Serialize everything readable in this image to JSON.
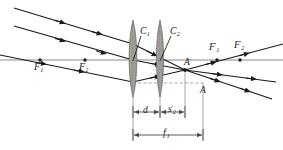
{
  "figure": {
    "type": "optical-ray-diagram",
    "colors": {
      "ray": "#1a1a1a",
      "axis": "#8c8c8c",
      "construction": "#9a9a9a",
      "lens_fill": "#a09c96",
      "label": "#1a1a1a"
    }
  },
  "labels": {
    "f1": {
      "base": "F",
      "sub": "1",
      "prime": ""
    },
    "f2": {
      "base": "F",
      "sub": "2",
      "prime": ""
    },
    "f1p": {
      "base": "F",
      "sub": "1",
      "prime": "′"
    },
    "f2p": {
      "base": "F",
      "sub": "2",
      "prime": "′"
    },
    "c1": {
      "base": "C",
      "sub": "1",
      "prime": ""
    },
    "c2": {
      "base": "C",
      "sub": "2",
      "prime": ""
    },
    "ap": {
      "base": "A",
      "sub": "",
      "prime": "′"
    },
    "a": {
      "base": "A",
      "sub": "",
      "prime": ""
    },
    "d": {
      "base": "d",
      "sub": "",
      "prime": ""
    },
    "s2p": {
      "base": "s",
      "sub": "2",
      "prime": "′"
    },
    "f1pdim": {
      "base": "f",
      "sub": "1",
      "prime": "′"
    }
  },
  "points": {
    "F1": {
      "x": 40,
      "y": 60
    },
    "F2": {
      "x": 85,
      "y": 60
    },
    "F1p": {
      "x": 217,
      "y": 60
    },
    "F2p": {
      "x": 240,
      "y": 60
    },
    "Aprime": {
      "x": 185,
      "y": 70
    },
    "A": {
      "x": 203,
      "y": 83
    },
    "C1": {
      "x": 133,
      "y": 60
    },
    "C2": {
      "x": 160,
      "y": 60
    }
  },
  "lenses": [
    {
      "name": "lens-1",
      "cx": 133,
      "top": 20,
      "bottom": 97,
      "half_width": 4.6
    },
    {
      "name": "lens-2",
      "cx": 160,
      "top": 20,
      "bottom": 97,
      "half_width": 4.2
    }
  ],
  "axis": {
    "y": 60,
    "x_start": 0,
    "x_end": 283
  },
  "dimensions": [
    {
      "name": "d",
      "x_from": 133,
      "x_to": 160,
      "y": 112
    },
    {
      "name": "s2prime",
      "x_from": 160,
      "x_to": 185,
      "y": 112
    },
    {
      "name": "f1prime",
      "x_from": 133,
      "x_to": 203,
      "y": 135
    }
  ],
  "incoming_rays": [
    {
      "x1": 14,
      "y1": 8,
      "x2": 133,
      "y2": 44
    },
    {
      "x1": 14,
      "y1": 26,
      "x2": 133,
      "y2": 60
    },
    {
      "x1": 0,
      "y1": 55,
      "x2": 133,
      "y2": 82
    }
  ],
  "outgoing_rays": [
    {
      "x1": 185,
      "y1": 70,
      "x2": 283,
      "y2": 44
    },
    {
      "x1": 185,
      "y1": 70,
      "x2": 276,
      "y2": 82
    },
    {
      "x1": 185,
      "y1": 70,
      "x2": 272,
      "y2": 99
    }
  ]
}
